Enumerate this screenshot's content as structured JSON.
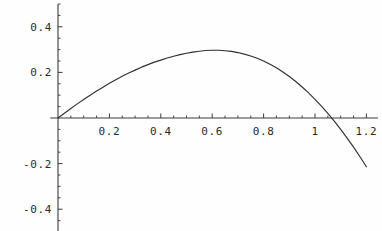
{
  "chart_data": {
    "type": "line",
    "title": "",
    "subtitle": "",
    "xlabel": "",
    "ylabel": "",
    "xlim": [
      -0.03,
      1.245
    ],
    "ylim": [
      -0.52,
      0.5
    ],
    "grid": false,
    "legend": null,
    "axis_style": "crossed-axes-at-origin",
    "line_color": "#303030",
    "axis_color": "#3a3a3a",
    "background_color": "#fefefe",
    "x_ticks_major": [
      0.2,
      0.4,
      0.6,
      0.8,
      1.0,
      1.2
    ],
    "x_tick_labels": [
      "0.2",
      "0.4",
      "0.6",
      "0.8",
      "1",
      "1.2"
    ],
    "x_ticks_minor": [
      0.05,
      0.1,
      0.15,
      0.25,
      0.3,
      0.35,
      0.45,
      0.5,
      0.55,
      0.65,
      0.7,
      0.75,
      0.85,
      0.9,
      0.95,
      1.05,
      1.1,
      1.15
    ],
    "y_ticks_major": [
      -0.4,
      -0.2,
      0.2,
      0.4
    ],
    "y_tick_labels": [
      "-0.4",
      "-0.2",
      "0.2",
      "0.4"
    ],
    "y_ticks_minor": [
      -0.5,
      -0.45,
      -0.35,
      -0.3,
      -0.25,
      -0.15,
      -0.1,
      -0.05,
      0.05,
      0.1,
      0.15,
      0.25,
      0.3,
      0.35,
      0.45,
      0.5
    ],
    "series": [
      {
        "name": "curve",
        "x": [
          0.0,
          0.025,
          0.05,
          0.075,
          0.1,
          0.125,
          0.15,
          0.175,
          0.2,
          0.225,
          0.25,
          0.275,
          0.3,
          0.325,
          0.35,
          0.375,
          0.4,
          0.425,
          0.45,
          0.475,
          0.5,
          0.525,
          0.55,
          0.575,
          0.6,
          0.625,
          0.65,
          0.675,
          0.7,
          0.725,
          0.75,
          0.775,
          0.8,
          0.825,
          0.85,
          0.875,
          0.9,
          0.925,
          0.95,
          0.975,
          1.0,
          1.025,
          1.05,
          1.075,
          1.1,
          1.125,
          1.15,
          1.175,
          1.2
        ],
        "y": [
          0.0,
          0.021,
          0.042,
          0.062,
          0.081,
          0.1,
          0.118,
          0.135,
          0.152,
          0.168,
          0.183,
          0.197,
          0.21,
          0.223,
          0.234,
          0.245,
          0.254,
          0.263,
          0.271,
          0.278,
          0.284,
          0.289,
          0.293,
          0.296,
          0.297,
          0.297,
          0.295,
          0.292,
          0.287,
          0.28,
          0.272,
          0.262,
          0.25,
          0.236,
          0.22,
          0.202,
          0.182,
          0.16,
          0.136,
          0.11,
          0.082,
          0.052,
          0.02,
          -0.014,
          -0.05,
          -0.088,
          -0.128,
          -0.17,
          -0.214
        ]
      }
    ],
    "annotations": {
      "origin": "0",
      "peak_approx_x": 0.57,
      "peak_approx_y": 0.33,
      "zero_crossing_x": 1.05,
      "endpoint_x": 1.2,
      "endpoint_y": -0.16
    }
  },
  "axes": {
    "x_axis_name": "horizontal-axis",
    "y_axis_name": "vertical-axis"
  }
}
